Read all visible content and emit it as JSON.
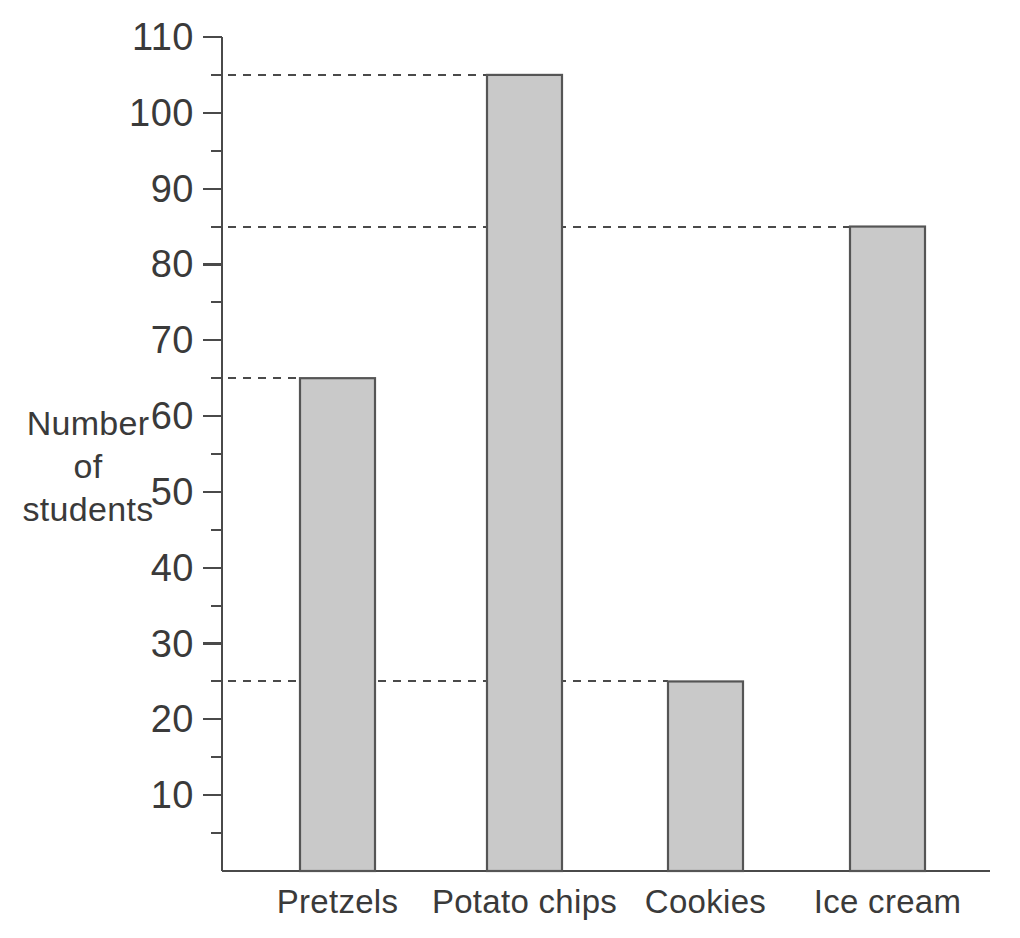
{
  "chart_data": {
    "type": "bar",
    "title": "",
    "xlabel": "",
    "ylabel": "Number of students",
    "categories": [
      "Pretzels",
      "Potato chips",
      "Cookies",
      "Ice cream"
    ],
    "values": [
      65,
      105,
      25,
      85
    ],
    "ylim": [
      0,
      110
    ],
    "ytick_step": 10,
    "yticks": [
      10,
      20,
      30,
      40,
      50,
      60,
      70,
      80,
      90,
      100,
      110
    ],
    "ytick_labels": [
      "10",
      "20",
      "30",
      "40",
      "50",
      "60",
      "70",
      "80",
      "90",
      "100",
      "110"
    ],
    "minor_ticks": [
      5,
      15,
      25,
      35,
      45,
      55,
      65,
      75,
      85,
      95,
      105
    ],
    "grid": false,
    "guide_lines": [
      105,
      85,
      65,
      25
    ],
    "legend": null,
    "legend_position": "none",
    "bar_fill_color": "#c9c9c9",
    "bar_edge_color": "#555555",
    "axis_color": "#4a4a4a",
    "background_color": "#ffffff"
  },
  "axis_title_lines": {
    "line1": "Number",
    "line2": "of",
    "line3": "students"
  },
  "geometry": {
    "baseline_y": 871,
    "top_y": 37,
    "axis_x": 222,
    "baseline_right_x": 990,
    "bar_width": 75,
    "bar_left_positions": [
      300,
      487,
      668,
      850
    ]
  }
}
